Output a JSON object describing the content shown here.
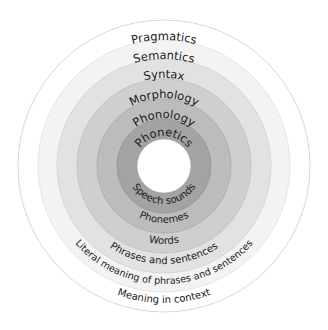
{
  "diagram": {
    "center": {
      "x": 164,
      "y": 166
    },
    "hole_radius": 27,
    "rings": [
      {
        "name": "Pragmatics",
        "label": "Pragmatics",
        "description": "Meaning in context",
        "outer_radius": 146,
        "fill": "#ffffff",
        "stroke": "#d8d8d8"
      },
      {
        "name": "Semantics",
        "label": "Semantics",
        "description": "Literal meaning of phrases and sentences",
        "outer_radius": 126,
        "fill": "#f3f3f3",
        "stroke": "#e6e6e6"
      },
      {
        "name": "Syntax",
        "label": "Syntax",
        "description": "Phrases and sentences",
        "outer_radius": 107,
        "fill": "#e2e2e2",
        "stroke": "#d6d6d6"
      },
      {
        "name": "Morphology",
        "label": "Morphology",
        "description": "Words",
        "outer_radius": 87,
        "fill": "#cfcfcf",
        "stroke": "#c4c4c4"
      },
      {
        "name": "Phonology",
        "label": "Phonology",
        "description": "Phonemes",
        "outer_radius": 67,
        "fill": "#bcbcbc",
        "stroke": "#b0b0b0"
      },
      {
        "name": "Phonetics",
        "label": "Phonetics",
        "description": "Speech sounds",
        "outer_radius": 47,
        "fill": "#a3a3a3",
        "stroke": "#999999"
      }
    ]
  }
}
